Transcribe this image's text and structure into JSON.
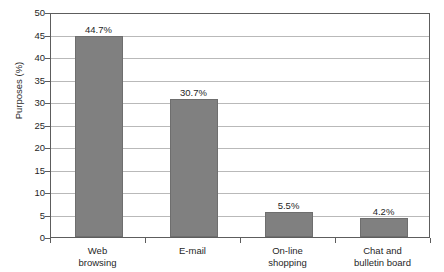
{
  "chart_data": {
    "type": "bar",
    "title": "",
    "xlabel": "",
    "ylabel": "Purposes (%)",
    "categories": [
      "Web browsing",
      "E-mail",
      "On-line shopping",
      "Chat and bulletin board"
    ],
    "category_lines": [
      [
        "Web",
        "browsing"
      ],
      [
        "E-mail",
        ""
      ],
      [
        "On-line",
        "shopping"
      ],
      [
        "Chat and",
        "bulletin board"
      ]
    ],
    "values": [
      44.7,
      30.7,
      5.5,
      4.2
    ],
    "value_labels": [
      "44.7%",
      "30.7%",
      "5.5%",
      "4.2%"
    ],
    "ylim": [
      0,
      50
    ],
    "ytick_step": 5,
    "yticks": [
      50,
      45,
      40,
      35,
      30,
      25,
      20,
      15,
      10,
      5,
      0
    ],
    "ytick_labels": [
      "50",
      "45",
      "40",
      "35",
      "30",
      "25",
      "20",
      "15",
      "10",
      "5",
      "0"
    ],
    "grid": true,
    "legend": false,
    "bar_color": "#808080",
    "bar_border_color": "#6e6e6e",
    "grid_color": "#b9b9b9",
    "axis_color": "#5d5d5d",
    "background": "#ffffff"
  },
  "clipped_title": ""
}
